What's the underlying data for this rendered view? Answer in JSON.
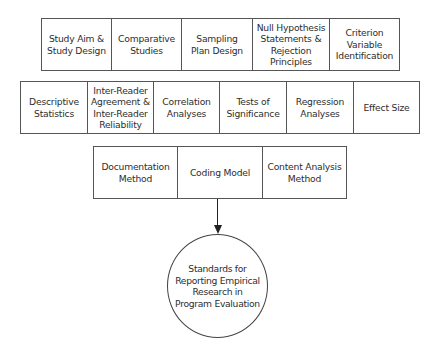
{
  "diagram": {
    "row1": [
      {
        "label": "Study Aim &\nStudy Design"
      },
      {
        "label": "Comparative\nStudies"
      },
      {
        "label": "Sampling\nPlan Design"
      },
      {
        "label": "Null Hypothesis\nStatements &\nRejection\nPrinciples"
      },
      {
        "label": "Criterion\nVariable\nIdentification"
      }
    ],
    "row2": [
      {
        "label": "Descriptive\nStatistics"
      },
      {
        "label": "Inter-Reader\nAgreement &\nInter-Reader\nReliability"
      },
      {
        "label": "Correlation\nAnalyses"
      },
      {
        "label": "Tests of\nSignificance"
      },
      {
        "label": "Regression\nAnalyses"
      },
      {
        "label": "Effect Size"
      }
    ],
    "row3": [
      {
        "label": "Documentation\nMethod"
      },
      {
        "label": "Coding Model"
      },
      {
        "label": "Content Analysis\nMethod"
      }
    ],
    "target": {
      "label": "Standards for\nReporting Empirical\nResearch in\nProgram Evaluation"
    },
    "colors": {
      "text": "#2e2e2e",
      "border": "#555555",
      "arrow": "#222222",
      "background": "#ffffff"
    }
  }
}
